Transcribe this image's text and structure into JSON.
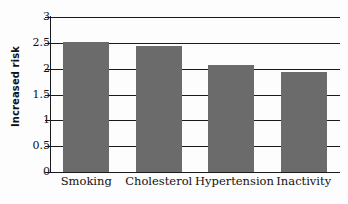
{
  "chart_data": {
    "type": "bar",
    "title": "",
    "subtitle": "",
    "xlabel": "",
    "ylabel": "Increased risk",
    "categories": [
      "Smoking",
      "Cholesterol",
      "Hypertension",
      "Inactivity"
    ],
    "values": [
      2.52,
      2.43,
      2.07,
      1.93
    ],
    "series": [
      {
        "name": "Increased risk",
        "values": [
          2.52,
          2.43,
          2.07,
          1.93
        ]
      }
    ],
    "ylim": [
      0,
      3
    ],
    "xlim": null,
    "ytick_labels": [
      "3",
      "2.5",
      "2",
      "1.5",
      "1",
      "0.5",
      "0"
    ],
    "ytick_values": [
      3,
      2.5,
      2,
      1.5,
      1,
      0.5,
      0
    ],
    "grid": true,
    "grid_axis": "y",
    "legend": false,
    "legend_position": "none",
    "annotations": [],
    "bar_color": "#6b6b6b",
    "axis_color": "#1a1a1a",
    "background_color": "#fdfdfd"
  }
}
